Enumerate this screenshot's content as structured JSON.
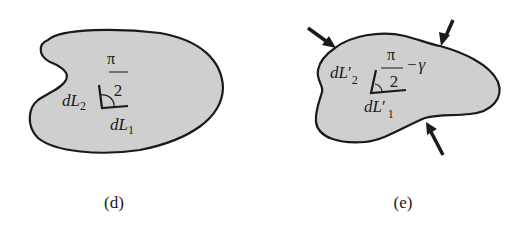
{
  "figure": {
    "panels": [
      {
        "id": "d",
        "caption": "(d)",
        "description": "undeformed body with right angle between line elements",
        "labels": {
          "dL2_d": "d",
          "dL2_L": "L",
          "dL2_sub": "2",
          "dL1_d": "d",
          "dL1_L": "L",
          "dL1_sub": "1",
          "angle_num": "π",
          "angle_den": "2"
        }
      },
      {
        "id": "e",
        "caption": "(e)",
        "description": "deformed body under compressive loads, angle reduced by shear strain",
        "labels": {
          "dL2_d": "d",
          "dL2_L": "L",
          "dL2_prime": "′",
          "dL2_sub": "2",
          "dL1_d": "d",
          "dL1_L": "L",
          "dL1_prime": "′",
          "dL1_sub": "1",
          "angle_num": "π",
          "angle_den": "2",
          "angle_minus": "−",
          "angle_gamma": "γ"
        },
        "arrows": 3
      }
    ],
    "colors": {
      "fill": "#cfcfcf",
      "stroke": "#1a1a1a",
      "background": "#ffffff"
    }
  }
}
